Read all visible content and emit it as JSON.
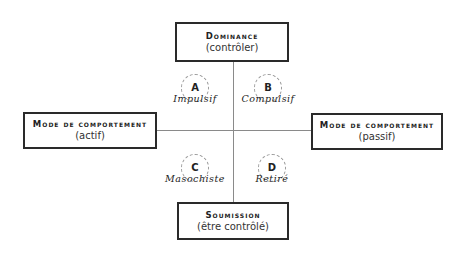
{
  "axes": {
    "top": {
      "title": "Dominance",
      "subtitle": "(contrôler)"
    },
    "bottom": {
      "title": "Soumission",
      "subtitle": "(être contrôlé)"
    },
    "left": {
      "title": "Mode de comportement",
      "subtitle": "(actif)"
    },
    "right": {
      "title": "Mode de comportement",
      "subtitle": "(passif)"
    }
  },
  "quadrants": [
    {
      "letter": "A",
      "label": "Impulsif"
    },
    {
      "letter": "B",
      "label": "Compulsif"
    },
    {
      "letter": "C",
      "label": "Masochiste"
    },
    {
      "letter": "D",
      "label": "Retiré"
    }
  ],
  "colors": {
    "line": "#8a8a8a",
    "border": "#2a2a2a",
    "circle": "#9a9a9a"
  }
}
